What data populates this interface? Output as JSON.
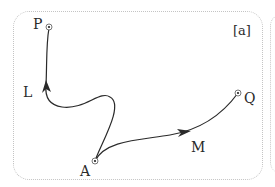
{
  "figure": {
    "panel_label": "[a]",
    "points": {
      "P": {
        "label": "P",
        "x": 49,
        "y": 27
      },
      "A": {
        "label": "A",
        "x": 95,
        "y": 161
      },
      "Q": {
        "label": "Q",
        "x": 238,
        "y": 93
      }
    },
    "paths": [
      {
        "name": "L",
        "label": "L",
        "from": "A",
        "to": "P"
      },
      {
        "name": "M",
        "label": "M",
        "from": "A",
        "to": "Q"
      }
    ],
    "colors": {
      "stroke": "#2a2a2a",
      "border": "#c4c4c4"
    }
  }
}
